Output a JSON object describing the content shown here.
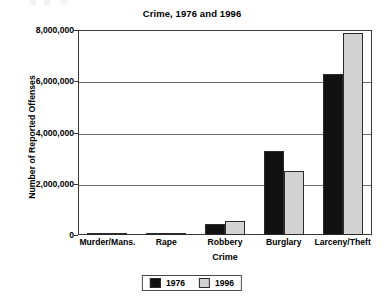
{
  "chart_data": {
    "type": "bar",
    "title": "Crime, 1976 and 1996",
    "xlabel": "Crime",
    "ylabel": "Number of Reported Offenses",
    "categories": [
      "Murder/Mans.",
      "Rape",
      "Robbery",
      "Burglary",
      "Larceny/Theft"
    ],
    "series": [
      {
        "name": "1976",
        "color": "#111111",
        "values": [
          20000,
          57000,
          421000,
          3270000,
          6270000
        ]
      },
      {
        "name": "1996",
        "color": "#d2d2d2",
        "values": [
          20000,
          96000,
          537000,
          2500000,
          7890000
        ]
      }
    ],
    "ylim": [
      0,
      8000000
    ],
    "ytick_values": [
      0,
      2000000,
      4000000,
      6000000,
      8000000
    ],
    "ytick_labels": [
      "0",
      "2,000,000",
      "4,000,000",
      "6,000,000",
      "8,000,000"
    ],
    "grid": true,
    "legend_position": "bottom",
    "legend_entries": [
      "1976",
      "1996"
    ]
  }
}
